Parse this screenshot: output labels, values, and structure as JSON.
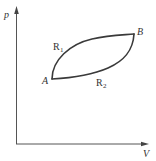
{
  "diagram": {
    "type": "p-V diagram",
    "axes": {
      "y_label": "p",
      "x_label": "V"
    },
    "points": [
      {
        "id": "A",
        "label": "A"
      },
      {
        "id": "B",
        "label": "B"
      }
    ],
    "paths": [
      {
        "id": "R1",
        "label_main": "R",
        "label_sub": "1",
        "from": "A",
        "to": "B",
        "position": "upper"
      },
      {
        "id": "R2",
        "label_main": "R",
        "label_sub": "2",
        "from": "A",
        "to": "B",
        "position": "lower"
      }
    ],
    "colors": {
      "axis": "#555555",
      "curve": "#3a3a3a",
      "text": "#333333",
      "background": "#ffffff"
    }
  }
}
